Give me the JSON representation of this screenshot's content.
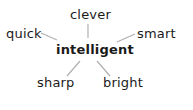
{
  "diagram": {
    "type": "word-web",
    "center": {
      "label": "intelligent"
    },
    "nodes": [
      {
        "label": "clever"
      },
      {
        "label": "quick"
      },
      {
        "label": "smart"
      },
      {
        "label": "sharp"
      },
      {
        "label": "bright"
      }
    ],
    "colors": {
      "text": "#1a1a1a",
      "line": "#b0b0b0",
      "background": "#ffffff"
    }
  }
}
